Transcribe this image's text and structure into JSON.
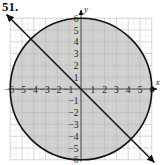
{
  "problem": {
    "number": "51."
  },
  "chart_data": {
    "type": "line",
    "title": "",
    "xlabel": "x",
    "ylabel": "y",
    "xlim": [
      -6,
      6
    ],
    "ylim": [
      -6,
      6
    ],
    "grid": true,
    "x_ticks": [
      "-6",
      "-5",
      "-4",
      "-3",
      "-2",
      "-1",
      "1",
      "2",
      "3",
      "4",
      "5",
      "6"
    ],
    "y_ticks": [
      "6",
      "5",
      "4",
      "3",
      "2",
      "1",
      "-1",
      "-2",
      "-3",
      "-4",
      "-5",
      "-6"
    ],
    "series": [
      {
        "name": "circle",
        "equation": "x^2 + y^2 = 36",
        "center": [
          0,
          0
        ],
        "radius": 6,
        "shaded": "inside"
      },
      {
        "name": "line",
        "equation": "y = -x",
        "slope": -1,
        "intercept": 0,
        "arrows": "both"
      }
    ],
    "intersections": [
      [
        -4.24,
        4.24
      ],
      [
        4.24,
        -4.24
      ]
    ],
    "colors": {
      "shade": "#cfcfcf",
      "grid": "#b8b8b8",
      "curve": "#111111",
      "background": "#ffffff"
    }
  }
}
